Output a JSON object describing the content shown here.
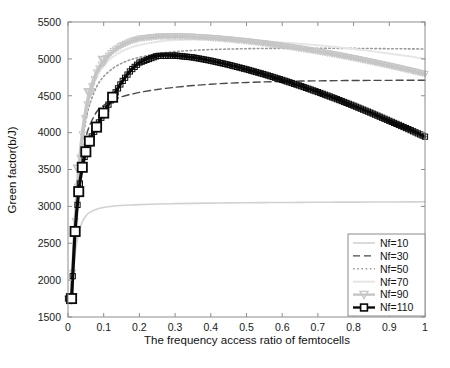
{
  "chart_data": {
    "type": "line",
    "title": "",
    "xlabel": "The frequency access ratio of femtocells",
    "ylabel": "Green factor(b/J)",
    "xlim": [
      0,
      1
    ],
    "ylim": [
      1500,
      5500
    ],
    "xticks": [
      "0",
      "0.1",
      "0.2",
      "0.3",
      "0.4",
      "0.5",
      "0.6",
      "0.7",
      "0.8",
      "0.9",
      "1"
    ],
    "yticks": [
      "1500",
      "2000",
      "2500",
      "3000",
      "3500",
      "4000",
      "4500",
      "5000",
      "5500"
    ],
    "grid": false,
    "legend_position": "lower-right",
    "x": [
      0.01,
      0.02,
      0.03,
      0.04,
      0.05,
      0.06,
      0.08,
      0.1,
      0.125,
      0.15,
      0.175,
      0.2,
      0.25,
      0.3,
      0.35,
      0.4,
      0.45,
      0.5,
      0.55,
      0.6,
      0.65,
      0.7,
      0.75,
      0.8,
      0.85,
      0.9,
      0.95,
      1.0
    ],
    "series": [
      {
        "name": "Nf=10",
        "color": "#d2d2d2",
        "style": "solid",
        "marker": "none",
        "width": 1.6,
        "values": [
          1750,
          2350,
          2640,
          2790,
          2870,
          2915,
          2962,
          2985,
          3002,
          3012,
          3019,
          3024,
          3032,
          3037,
          3041,
          3044,
          3047,
          3049,
          3051,
          3053,
          3054,
          3056,
          3057,
          3058,
          3059,
          3060,
          3061,
          3062
        ]
      },
      {
        "name": "Nf=30",
        "color": "#4a4a4a",
        "style": "dashed",
        "marker": "none",
        "width": 1.4,
        "values": [
          1750,
          2700,
          3300,
          3680,
          3930,
          4090,
          4280,
          4370,
          4440,
          4485,
          4518,
          4545,
          4585,
          4615,
          4638,
          4656,
          4670,
          4680,
          4688,
          4694,
          4699,
          4702,
          4705,
          4707,
          4708,
          4709,
          4710,
          4710
        ]
      },
      {
        "name": "Nf=50",
        "color": "#9a9a9a",
        "style": "dotted",
        "marker": "none",
        "width": 1.6,
        "values": [
          1750,
          2760,
          3420,
          3860,
          4160,
          4370,
          4620,
          4760,
          4870,
          4940,
          4988,
          5022,
          5070,
          5098,
          5115,
          5126,
          5133,
          5138,
          5141,
          5143,
          5144,
          5144,
          5143,
          5142,
          5140,
          5138,
          5136,
          5134
        ]
      },
      {
        "name": "Nf=70",
        "color": "#e6e6e6",
        "style": "solid",
        "marker": "none",
        "width": 2.0,
        "values": [
          1750,
          2790,
          3480,
          3940,
          4260,
          4480,
          4750,
          4905,
          5025,
          5100,
          5152,
          5188,
          5233,
          5255,
          5264,
          5265,
          5260,
          5250,
          5238,
          5222,
          5204,
          5184,
          5160,
          5134,
          5105,
          5072,
          5038,
          5000
        ]
      },
      {
        "name": "Nf=90",
        "color": "#c6c6c6",
        "style": "solid",
        "marker": "triangle-down",
        "width": 3.4,
        "values": [
          1750,
          2800,
          3500,
          3975,
          4305,
          4535,
          4815,
          4975,
          5100,
          5180,
          5235,
          5272,
          5300,
          5305,
          5298,
          5283,
          5262,
          5237,
          5208,
          5175,
          5138,
          5098,
          5055,
          5008,
          4958,
          4905,
          4850,
          4793
        ]
      },
      {
        "name": "Nf=110",
        "color": "#0a0a0a",
        "style": "solid",
        "marker": "square",
        "width": 3.2,
        "values": [
          1750,
          2660,
          3200,
          3530,
          3740,
          3885,
          4075,
          4265,
          4480,
          4680,
          4840,
          4950,
          5040,
          5045,
          5020,
          4975,
          4920,
          4858,
          4790,
          4715,
          4635,
          4550,
          4460,
          4365,
          4265,
          4160,
          4055,
          3945
        ]
      }
    ]
  },
  "legend": {
    "items": [
      {
        "label": "Nf=10"
      },
      {
        "label": "Nf=30"
      },
      {
        "label": "Nf=50"
      },
      {
        "label": "Nf=70"
      },
      {
        "label": "Nf=90"
      },
      {
        "label": "Nf=110"
      }
    ]
  }
}
